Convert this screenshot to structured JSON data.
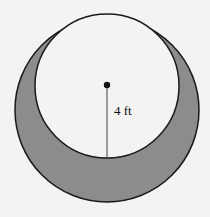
{
  "figure": {
    "outer_circle": {
      "cx": 107,
      "cy": 110,
      "r": 92
    },
    "inner_circle": {
      "cx": 107,
      "cy": 86,
      "r": 72
    },
    "center_point": {
      "cx": 107,
      "cy": 85,
      "r": 3.2
    },
    "radius_line": {
      "x1": 107,
      "y1": 85,
      "x2": 107,
      "y2": 158
    },
    "radius_label": "4 ft",
    "colors": {
      "background": "#f3f3f1",
      "shaded_region": "#8c8c8c",
      "inner_fill": "#f3f3f1",
      "stroke": "#1a1a1a"
    }
  }
}
